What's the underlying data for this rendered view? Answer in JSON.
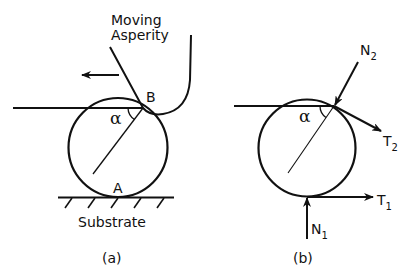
{
  "figure": {
    "panel_a": {
      "caption": "(a)",
      "asperity_label_line1": "Moving",
      "asperity_label_line2": "Asperity",
      "contact_top_label": "B",
      "contact_bottom_label": "A",
      "angle_label": "α",
      "substrate_label": "Substrate",
      "motion_direction": "left"
    },
    "panel_b": {
      "caption": "(b)",
      "angle_label": "α",
      "force_labels": {
        "N2_main": "N",
        "N2_sub": "2",
        "T2_main": "T",
        "T2_sub": "2",
        "T1_main": "T",
        "T1_sub": "1",
        "N1_main": "N",
        "N1_sub": "1"
      }
    },
    "colors": {
      "line": "#111111",
      "background": "#ffffff"
    }
  }
}
